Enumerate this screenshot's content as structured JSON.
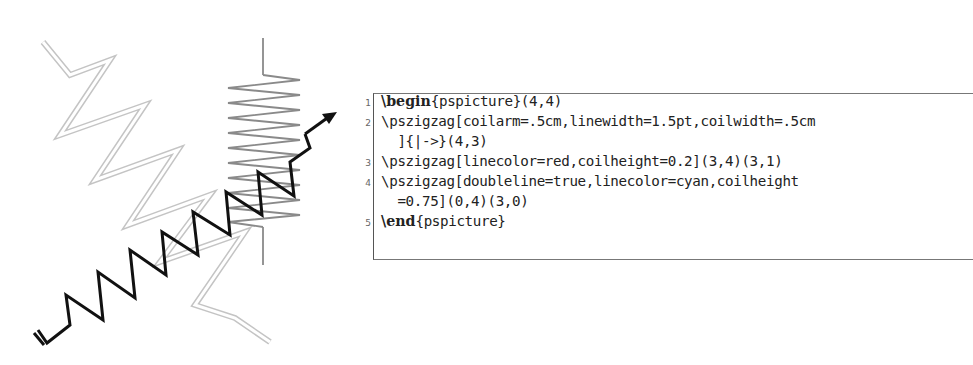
{
  "figure": {
    "double_zigzag": {
      "color": "#c8c8c8",
      "points": "43,42 70,75 110,60 60,135 145,105 95,180 178,150 128,225 210,195 160,262 245,232 195,305 235,318 270,342"
    },
    "vertical_coil": {
      "color": "#8a8a8a",
      "top_stub": "263,38 263,75",
      "bottom_stub": "263,227 263,265",
      "coil_points": "263,75 300,80 228,88 300,95 228,103 300,110 228,118 300,125 228,133 300,140 228,148 300,155 228,163 300,170 228,178 300,185 228,193 300,200 228,208 300,215 228,222 263,227"
    },
    "black_zigzag": {
      "color": "#111111",
      "points": "38,330 47,343 70,325 66,295 103,320 98,272 135,298 130,250 166,275 162,232 198,255 193,212 230,235 226,192 262,215 258,172 294,196 290,162 310,148 305,134",
      "arrow_tip": "335,113"
    }
  },
  "code": {
    "line_numbers": [
      "1",
      "2",
      "",
      "3",
      "4",
      "",
      "5"
    ],
    "lines": [
      {
        "kw": "\\begin",
        "rest": "{pspicture}(4,4)"
      },
      {
        "kw": "",
        "rest": "\\pszigzag[coilarm=.5cm,linewidth=1.5pt,coilwidth=.5cm"
      },
      {
        "kw": "",
        "rest": "  ]{|->}(4,3)"
      },
      {
        "kw": "",
        "rest": "\\pszigzag[linecolor=red,coilheight=0.2](3,4)(3,1)"
      },
      {
        "kw": "",
        "rest": "\\pszigzag[doubleline=true,linecolor=cyan,coilheight"
      },
      {
        "kw": "",
        "rest": "  =0.75](0,4)(3,0)"
      },
      {
        "kw": "\\end",
        "rest": "{pspicture}"
      }
    ]
  }
}
